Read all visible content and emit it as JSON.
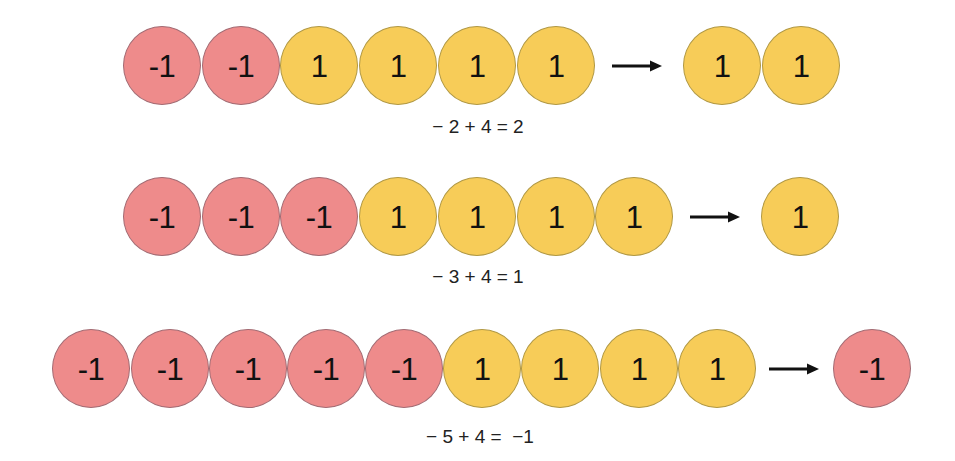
{
  "colors": {
    "negative_fill": "#EE8B8B",
    "negative_border": "#A26B73",
    "positive_fill": "#F7CC58",
    "positive_border": "#B09844",
    "text": "#111111",
    "arrow": "#111111"
  },
  "rows": [
    {
      "counters": [
        "-1",
        "-1",
        "1",
        "1",
        "1",
        "1"
      ],
      "arrow_icon": "right-arrow-icon",
      "result": [
        "1",
        "1"
      ],
      "equation": "− 2 + 4 = 2"
    },
    {
      "counters": [
        "-1",
        "-1",
        "-1",
        "1",
        "1",
        "1",
        "1"
      ],
      "arrow_icon": "right-arrow-icon",
      "result": [
        "1"
      ],
      "equation": "− 3 + 4 = 1"
    },
    {
      "counters": [
        "-1",
        "-1",
        "-1",
        "-1",
        "-1",
        "1",
        "1",
        "1",
        "1"
      ],
      "arrow_icon": "right-arrow-icon",
      "result": [
        "-1"
      ],
      "equation": "− 5 + 4 =  −1"
    }
  ]
}
